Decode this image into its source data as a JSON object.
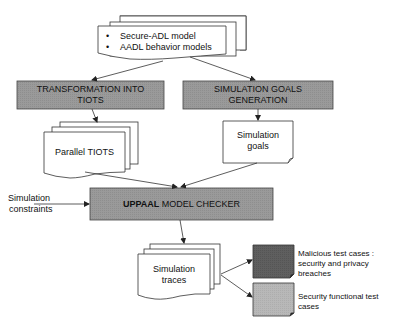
{
  "diagram": {
    "inputs": {
      "items": [
        "Secure-ADL  model",
        "AADL behavior models"
      ]
    },
    "process_transform": {
      "line1": "TRANSFORMATION INTO",
      "line2": "TIOTS"
    },
    "process_goals": {
      "line1": "SIMULATION GOALS",
      "line2": "GENERATION"
    },
    "doc_parallel_tiots": {
      "label": "Parallel TIOTS"
    },
    "doc_simulation_goals": {
      "line1": "Simulation",
      "line2": "goals"
    },
    "constraints": {
      "line1": "Simulation",
      "line2": "constraints"
    },
    "model_checker": {
      "bold": "UPPAAL",
      "rest": " MODEL CHECKER"
    },
    "doc_simulation_traces": {
      "line1": "Simulation",
      "line2": "traces"
    },
    "outputs": [
      {
        "line1": "Malicious test cases :",
        "line2": "security and privacy",
        "line3": "breaches",
        "color": "#5f5f5f"
      },
      {
        "line1": "Security functional test",
        "line2": "cases",
        "color": "#b4b4b4"
      }
    ],
    "colors": {
      "process_fill": "#9a9a9a",
      "stroke": "#333333",
      "doc_fill": "#ffffff"
    }
  }
}
